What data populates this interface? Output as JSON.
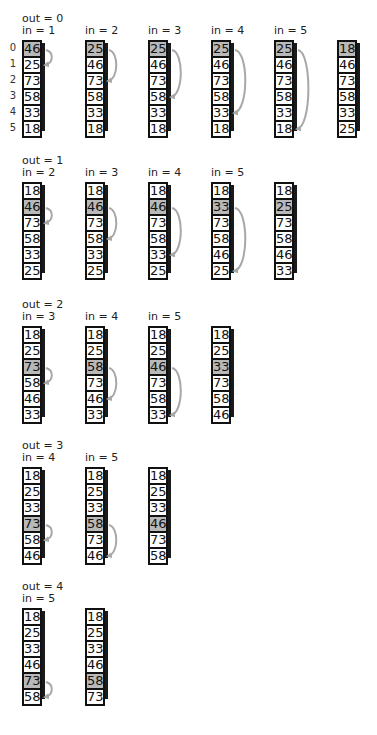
{
  "colors": {
    "highlight": "#b9b9b9",
    "arrow": "#a8a8a8",
    "border": "#111111"
  },
  "index_labels": [
    "0",
    "1",
    "2",
    "3",
    "4",
    "5"
  ],
  "passes": [
    {
      "out_label": "out = 0",
      "steps": [
        {
          "in_label": "in = 1",
          "values": [
            "46",
            "25",
            "73",
            "58",
            "33",
            "18"
          ],
          "highlight": 0,
          "arrow_to": 1
        },
        {
          "in_label": "in = 2",
          "values": [
            "25",
            "46",
            "73",
            "58",
            "33",
            "18"
          ],
          "highlight": 0,
          "arrow_to": 2
        },
        {
          "in_label": "in = 3",
          "values": [
            "25",
            "46",
            "73",
            "58",
            "33",
            "18"
          ],
          "highlight": 0,
          "arrow_to": 3
        },
        {
          "in_label": "in = 4",
          "values": [
            "25",
            "46",
            "73",
            "58",
            "33",
            "18"
          ],
          "highlight": 0,
          "arrow_to": 4
        },
        {
          "in_label": "in = 5",
          "values": [
            "25",
            "46",
            "73",
            "58",
            "33",
            "18"
          ],
          "highlight": 0,
          "arrow_to": 5
        },
        {
          "in_label": "",
          "values": [
            "18",
            "46",
            "73",
            "58",
            "33",
            "25"
          ],
          "highlight": 0,
          "arrow_to": null
        }
      ]
    },
    {
      "out_label": "out = 1",
      "steps": [
        {
          "in_label": "in = 2",
          "values": [
            "18",
            "46",
            "73",
            "58",
            "33",
            "25"
          ],
          "highlight": 1,
          "arrow_to": 2
        },
        {
          "in_label": "in = 3",
          "values": [
            "18",
            "46",
            "73",
            "58",
            "33",
            "25"
          ],
          "highlight": 1,
          "arrow_to": 3
        },
        {
          "in_label": "in = 4",
          "values": [
            "18",
            "46",
            "73",
            "58",
            "33",
            "25"
          ],
          "highlight": 1,
          "arrow_to": 4
        },
        {
          "in_label": "in = 5",
          "values": [
            "18",
            "33",
            "73",
            "58",
            "46",
            "25"
          ],
          "highlight": 1,
          "arrow_to": 5
        },
        {
          "in_label": "",
          "values": [
            "18",
            "25",
            "73",
            "58",
            "46",
            "33"
          ],
          "highlight": 1,
          "arrow_to": null
        }
      ]
    },
    {
      "out_label": "out = 2",
      "steps": [
        {
          "in_label": "in = 3",
          "values": [
            "18",
            "25",
            "73",
            "58",
            "46",
            "33"
          ],
          "highlight": 2,
          "arrow_to": 3
        },
        {
          "in_label": "in = 4",
          "values": [
            "18",
            "25",
            "58",
            "73",
            "46",
            "33"
          ],
          "highlight": 2,
          "arrow_to": 4
        },
        {
          "in_label": "in = 5",
          "values": [
            "18",
            "25",
            "46",
            "73",
            "58",
            "33"
          ],
          "highlight": 2,
          "arrow_to": 5
        },
        {
          "in_label": "",
          "values": [
            "18",
            "25",
            "33",
            "73",
            "58",
            "46"
          ],
          "highlight": 2,
          "arrow_to": null
        }
      ]
    },
    {
      "out_label": "out = 3",
      "steps": [
        {
          "in_label": "in = 4",
          "values": [
            "18",
            "25",
            "33",
            "73",
            "58",
            "46"
          ],
          "highlight": 3,
          "arrow_to": 4
        },
        {
          "in_label": "in = 5",
          "values": [
            "18",
            "25",
            "33",
            "58",
            "73",
            "46"
          ],
          "highlight": 3,
          "arrow_to": 5
        },
        {
          "in_label": "",
          "values": [
            "18",
            "25",
            "33",
            "46",
            "73",
            "58"
          ],
          "highlight": 3,
          "arrow_to": null
        }
      ]
    },
    {
      "out_label": "out = 4",
      "steps": [
        {
          "in_label": "in = 5",
          "values": [
            "18",
            "25",
            "33",
            "46",
            "73",
            "58"
          ],
          "highlight": 4,
          "arrow_to": 5
        },
        {
          "in_label": "",
          "values": [
            "18",
            "25",
            "33",
            "46",
            "58",
            "73"
          ],
          "highlight": 4,
          "arrow_to": null
        }
      ]
    }
  ]
}
